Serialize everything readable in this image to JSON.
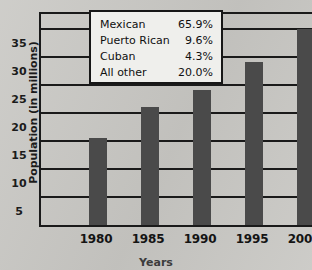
{
  "chart_data": {
    "type": "bar",
    "title": "",
    "xlabel": "Years",
    "ylabel": "Population (in millions)",
    "categories": [
      "1980",
      "1985",
      "1990",
      "1995",
      "2000"
    ],
    "values": [
      15.5,
      21,
      24,
      29,
      35
    ],
    "ylim": [
      0,
      38
    ],
    "yticks": [
      5,
      10,
      15,
      20,
      25,
      30,
      35
    ],
    "ytick_labels": [
      "5",
      "10",
      "15",
      "20",
      "25",
      "30",
      "35"
    ],
    "grid": true,
    "legend_position": "upper-left-inside",
    "bar_color": "#4a4a4a",
    "background_color": "#c9c8c4",
    "axis_color": "#1a1a1a",
    "breakdown": {
      "rows": [
        {
          "label": "Mexican",
          "value": "65.9%"
        },
        {
          "label": "Puerto Rican",
          "value": "9.6%"
        },
        {
          "label": "Cuban",
          "value": "4.3%"
        },
        {
          "label": "All other",
          "value": "20.0%"
        }
      ]
    }
  }
}
